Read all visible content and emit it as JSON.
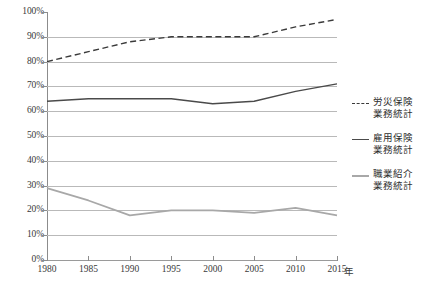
{
  "chart_data": {
    "type": "line",
    "title": "",
    "xlabel": "年",
    "ylabel": "",
    "grid": true,
    "legend_position": "right",
    "x": [
      1980,
      1985,
      1990,
      1995,
      2000,
      2005,
      2010,
      2015
    ],
    "xlim": [
      1980,
      2015
    ],
    "ylim": [
      0,
      100
    ],
    "y_ticks": [
      0,
      10,
      20,
      30,
      40,
      50,
      60,
      70,
      80,
      90,
      100
    ],
    "y_tick_labels": [
      "0%",
      "10%",
      "20%",
      "30%",
      "40%",
      "50%",
      "60%",
      "70%",
      "80%",
      "90%",
      "100%"
    ],
    "x_tick_labels": [
      "1980",
      "1985",
      "1990",
      "1995",
      "2000",
      "2005",
      "2010",
      "2015"
    ],
    "series": [
      {
        "name": "労災保険業務統計",
        "style": "dashed",
        "color": "#3a3a3a",
        "values": [
          80,
          84,
          88,
          90,
          90,
          90,
          94,
          97
        ]
      },
      {
        "name": "雇用保険業務統計",
        "style": "solid",
        "color": "#4a4a4a",
        "values": [
          64,
          65,
          65,
          65,
          63,
          64,
          68,
          71
        ]
      },
      {
        "name": "職業紹介業務統計",
        "style": "solid",
        "color": "#a8a8a8",
        "values": [
          29,
          24,
          18,
          20,
          20,
          19,
          21,
          18
        ]
      }
    ]
  },
  "legend": {
    "items": [
      {
        "label_line1": "労災保険",
        "label_line2": "業務統計",
        "style": "dashed",
        "color": "#3a3a3a"
      },
      {
        "label_line1": "雇用保険",
        "label_line2": "業務統計",
        "style": "solid",
        "color": "#4a4a4a"
      },
      {
        "label_line1": "職業紹介",
        "label_line2": "業務統計",
        "style": "solid",
        "color": "#a8a8a8"
      }
    ]
  },
  "axes": {
    "x_unit": "年"
  }
}
